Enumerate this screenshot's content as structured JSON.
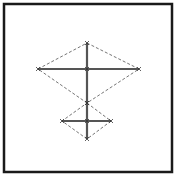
{
  "diagram": {
    "colors": {
      "background": "#ffffff",
      "frame": "#1a1a1a",
      "solid_bars": "#555555",
      "dashed_outline": "#666666"
    },
    "frame": {
      "x": 4,
      "y": 4,
      "width": 168,
      "height": 168,
      "stroke_width": 2.5
    },
    "upper_diamond": {
      "top": [
        87,
        43
      ],
      "left": [
        38,
        69
      ],
      "right": [
        139,
        69
      ],
      "bottom": [
        87,
        103
      ],
      "center": [
        87,
        69
      ]
    },
    "lower_diamond": {
      "top": [
        87,
        103
      ],
      "left": [
        62,
        121
      ],
      "right": [
        111,
        121
      ],
      "bottom": [
        87,
        139
      ],
      "center": [
        87,
        121
      ]
    },
    "vertical_spine": {
      "from": [
        87,
        43
      ],
      "to": [
        87,
        139
      ]
    }
  }
}
